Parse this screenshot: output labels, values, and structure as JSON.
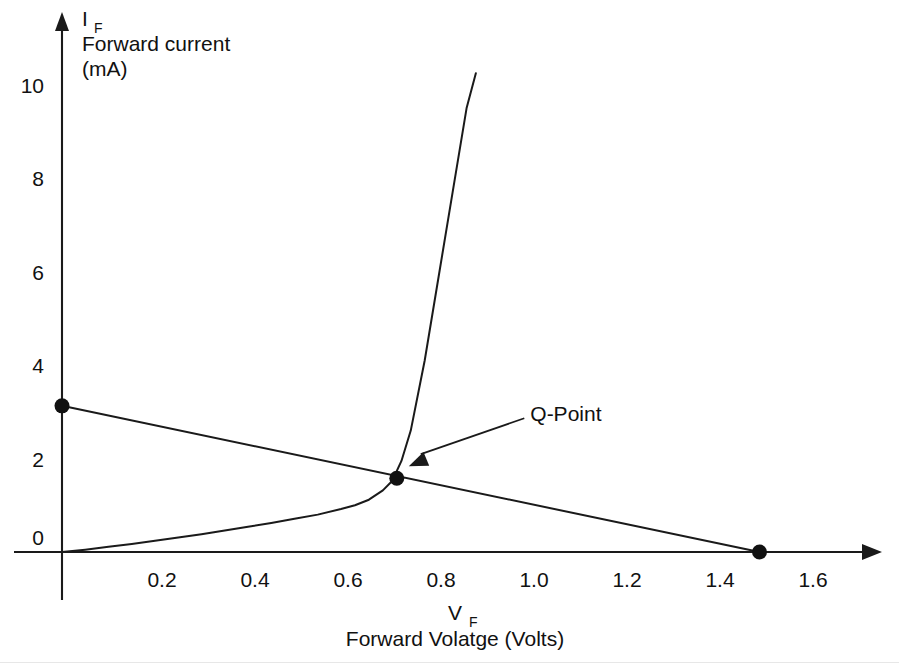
{
  "chart_data": {
    "type": "line",
    "title": "",
    "xlabel": "Forward Volatge (Volts)",
    "xlabel_symbol": "V",
    "xlabel_symbol_sub": "F",
    "ylabel": "Forward current",
    "ylabel_units": "(mA)",
    "ylabel_symbol": "I",
    "ylabel_symbol_sub": "F",
    "xlim": [
      0.0,
      1.75
    ],
    "ylim": [
      0.0,
      10.9
    ],
    "xticks": [
      "0.2",
      "0.4",
      "0.6",
      "0.8",
      "1.0",
      "1.2",
      "1.4",
      "1.6"
    ],
    "xtick_values": [
      0.2,
      0.4,
      0.6,
      0.8,
      1.0,
      1.2,
      1.4,
      1.6
    ],
    "yticks": [
      "0",
      "2",
      "4",
      "6",
      "8",
      "10"
    ],
    "ytick_values": [
      0,
      2,
      4,
      6,
      8,
      10
    ],
    "grid": false,
    "legend": false,
    "series": [
      {
        "name": "Diode forward characteristic",
        "type": "line",
        "x": [
          0.0,
          0.05,
          0.1,
          0.15,
          0.2,
          0.25,
          0.3,
          0.35,
          0.4,
          0.45,
          0.5,
          0.55,
          0.6,
          0.63,
          0.66,
          0.69,
          0.71,
          0.73,
          0.75,
          0.78,
          0.81,
          0.84,
          0.87,
          0.89
        ],
        "y": [
          0.0,
          0.05,
          0.11,
          0.17,
          0.24,
          0.31,
          0.38,
          0.46,
          0.54,
          0.62,
          0.71,
          0.8,
          0.92,
          1.0,
          1.12,
          1.32,
          1.52,
          1.95,
          2.6,
          4.1,
          5.9,
          7.7,
          9.5,
          10.25
        ]
      },
      {
        "name": "Load line",
        "type": "line",
        "x": [
          0.0,
          1.5
        ],
        "y": [
          3.13,
          0.0
        ]
      }
    ],
    "markers": [
      {
        "name": "load-line-y-intercept",
        "x": 0.0,
        "y": 3.13
      },
      {
        "name": "q-point",
        "x": 0.72,
        "y": 1.58
      },
      {
        "name": "load-line-x-intercept",
        "x": 1.5,
        "y": 0.0
      }
    ],
    "annotations": [
      {
        "name": "q-point-annotation",
        "text": "Q-Point",
        "target_x": 0.72,
        "target_y": 1.58,
        "label_x": 1.02,
        "label_y": 2.95
      }
    ]
  },
  "axes": {
    "y_axis_name": "I",
    "y_axis_sub": "F",
    "y_axis_desc": "Forward current",
    "y_axis_units": "(mA)",
    "x_axis_name": "V",
    "x_axis_sub": "F",
    "x_axis_desc": "Forward Volatge (Volts)"
  },
  "tick_labels": {
    "x": [
      "0.2",
      "0.4",
      "0.6",
      "0.8",
      "1.0",
      "1.2",
      "1.4",
      "1.6"
    ],
    "y": [
      "0",
      "2",
      "4",
      "6",
      "8",
      "10"
    ]
  },
  "colors": {
    "ink": "#1a1a1a",
    "background": "#ffffff"
  }
}
